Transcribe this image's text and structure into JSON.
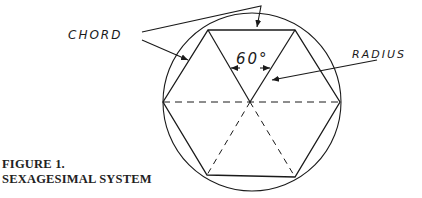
{
  "figure": {
    "labels": {
      "chord": "CHORD",
      "radius": "RADIUS",
      "angle": "60°"
    },
    "caption": {
      "line1": "FIGURE 1.",
      "line2": "SEXAGESIMAL SYSTEM"
    },
    "geometry": {
      "circle": {
        "cx": 252,
        "cy": 102,
        "r": 89
      },
      "hexagon_vertices": [
        [
          163,
          102
        ],
        [
          208,
          30
        ],
        [
          295,
          30
        ],
        [
          340,
          102
        ],
        [
          295,
          177
        ],
        [
          207,
          175
        ]
      ],
      "center": [
        250,
        102
      ],
      "solid_radii": [
        "center-to-top-left",
        "center-to-top-right"
      ],
      "dashed_lines": [
        "horizontal diameter",
        "center-to-bottom-left",
        "center-to-bottom-right"
      ],
      "central_angle_degrees": 60
    },
    "colors": {
      "ink": "#1a1a1a",
      "paper": "#ffffff"
    }
  }
}
